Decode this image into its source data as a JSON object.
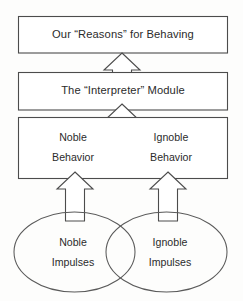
{
  "diagram": {
    "stroke_color": "#4c4c4c",
    "ellipse_stroke_color": "#5a5a5a",
    "text_color": "#2b2b2b",
    "background_color": "#fdfdfc",
    "boxes": [
      {
        "id": "reasons",
        "label": "Our “Reasons” for Behaving"
      },
      {
        "id": "interpreter",
        "label": "The “Interpreter” Module"
      }
    ],
    "behavior_box": {
      "id": "behavior",
      "left": {
        "line1": "Noble",
        "line2": "Behavior"
      },
      "right": {
        "line1": "Ignoble",
        "line2": "Behavior"
      }
    },
    "ellipses": [
      {
        "id": "noble-impulses",
        "line1": "Noble",
        "line2": "Impulses"
      },
      {
        "id": "ignoble-impulses",
        "line1": "Ignoble",
        "line2": "Impulses"
      }
    ],
    "arrows": [
      {
        "id": "arrow-interpreter-to-reasons",
        "direction": "up"
      },
      {
        "id": "arrow-behavior-to-interpreter",
        "direction": "up"
      },
      {
        "id": "arrow-noble-impulses-to-behavior",
        "direction": "up"
      },
      {
        "id": "arrow-ignoble-impulses-to-behavior",
        "direction": "up"
      }
    ]
  }
}
